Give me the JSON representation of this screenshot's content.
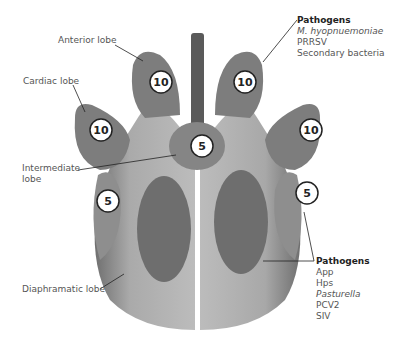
{
  "diagram": {
    "lobes": [
      {
        "id": "anterior-left",
        "name": "Anterior lobe",
        "score": "10"
      },
      {
        "id": "anterior-right",
        "score": "10"
      },
      {
        "id": "cardiac-left",
        "name": "Cardiac lobe",
        "score": "10"
      },
      {
        "id": "cardiac-right",
        "score": "10"
      },
      {
        "id": "intermediate",
        "name": "Intermediate lobe",
        "score": "5"
      },
      {
        "id": "diaphragmatic-left",
        "name": "Diaphramatic lobe",
        "score": "5"
      },
      {
        "id": "diaphragmatic-right",
        "score": "5"
      }
    ],
    "labels": {
      "anterior": "Anterior lobe",
      "cardiac": "Cardiac lobe",
      "intermediate_1": "Intermediate",
      "intermediate_2": "lobe",
      "diaphragmatic": "Diaphramatic lobe"
    },
    "pathogens_top": {
      "heading": "Pathogens",
      "items": [
        "M. hyopnuemoniae",
        "PRRSV",
        "Secondary bacteria"
      ]
    },
    "pathogens_bottom": {
      "heading": "Pathogens",
      "items": [
        "App",
        "Hps",
        "Pasturella",
        "PCV2",
        "SIV"
      ]
    },
    "colors": {
      "lobe_dark": "#7d7d7d",
      "lobe_mid": "#9a9a9a",
      "lobe_light": "#b5b5b5",
      "lesion": "#6e6e6e",
      "trachea": "#555555"
    }
  }
}
